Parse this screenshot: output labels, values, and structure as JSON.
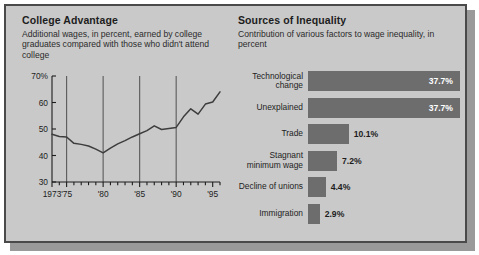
{
  "left_panel": {
    "title": "College Advantage",
    "subtitle": "Additional wages, in percent, earned by college graduates compared with those who didn't attend college"
  },
  "right_panel": {
    "title": "Sources of Inequality",
    "subtitle": "Contribution of various factors to wage inequality, in percent"
  },
  "colors": {
    "background": "#c9c9c9",
    "frame_border": "#4a4a4a",
    "bar_fill": "#6d6d6d",
    "line": "#3d3d3d",
    "gridline": "#5a5a5a",
    "text": "#1d1d1d",
    "value_inside": "#ffffff"
  },
  "chart_data": [
    {
      "type": "line",
      "title": "College Advantage",
      "subtitle": "Additional wages, in percent, earned by college graduates compared with those who didn't attend college",
      "xlabel": "",
      "ylabel": "",
      "ylim": [
        30,
        70
      ],
      "xlim": [
        1973,
        1996
      ],
      "yticks": [
        30,
        40,
        50,
        60,
        70
      ],
      "ytick_labels": [
        "30",
        "40",
        "50",
        "60",
        "70%"
      ],
      "xticks": [
        1973,
        1975,
        1980,
        1985,
        1990,
        1995
      ],
      "xtick_labels": [
        "1973",
        "'75",
        "'80",
        "'85",
        "'90",
        "'95"
      ],
      "gridlines_x": [
        1975,
        1980,
        1985,
        1990
      ],
      "grid": true,
      "x": [
        1973,
        1974,
        1975,
        1976,
        1977,
        1978,
        1979,
        1980,
        1981,
        1982,
        1983,
        1984,
        1985,
        1986,
        1987,
        1988,
        1989,
        1990,
        1991,
        1992,
        1993,
        1994,
        1995,
        1996
      ],
      "values": [
        48.0,
        47.2,
        47.0,
        44.6,
        44.2,
        43.6,
        42.4,
        41.0,
        42.8,
        44.4,
        45.6,
        47.0,
        48.2,
        49.4,
        51.2,
        49.8,
        50.2,
        50.6,
        54.6,
        57.6,
        55.6,
        59.4,
        60.2,
        64.0
      ]
    },
    {
      "type": "bar",
      "orientation": "horizontal",
      "title": "Sources of Inequality",
      "subtitle": "Contribution of various factors to wage inequality, in percent",
      "xlabel": "",
      "ylabel": "",
      "xlim": [
        0,
        37.7
      ],
      "categories": [
        "Technological change",
        "Unexplained",
        "Trade",
        "Stagnant minimum wage",
        "Decline of unions",
        "Immigration"
      ],
      "values": [
        37.7,
        37.7,
        10.1,
        7.2,
        4.4,
        2.9
      ],
      "value_labels": [
        "37.7%",
        "37.7%",
        "10.1%",
        "7.2%",
        "4.4%",
        "2.9%"
      ],
      "label_placement": [
        "inside",
        "inside",
        "outside",
        "outside",
        "outside",
        "outside"
      ]
    }
  ]
}
